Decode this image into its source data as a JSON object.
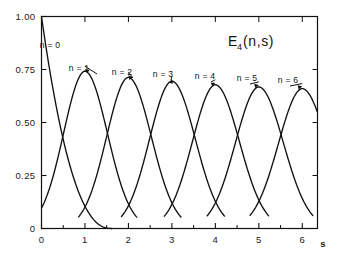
{
  "figure": {
    "title_base": "E",
    "title_subscript": "4",
    "title_args": "(n,s)",
    "background_color": "#ffffff",
    "line_color": "#111111"
  },
  "axes": {
    "x_unit": "s",
    "x_tick_labels": [
      "0",
      "1",
      "2",
      "3",
      "4",
      "5",
      "6"
    ],
    "x_tick_values": [
      0,
      1,
      2,
      3,
      4,
      5,
      6
    ],
    "x_minor_tick_values": [
      0.5,
      1.5,
      2.5,
      3.5,
      4.5,
      5.5
    ],
    "y_tick_labels": [
      "0",
      "0.25",
      "0.50",
      "0.75",
      "1.00"
    ],
    "y_tick_values": [
      0,
      0.25,
      0.5,
      0.75,
      1.0
    ],
    "xlim": [
      0,
      6.35
    ],
    "ylim": [
      0,
      1.0
    ],
    "grid": false
  },
  "curve_labels": [
    {
      "text": "n = 0",
      "n": 0,
      "has_arrow": false
    },
    {
      "text": "n = 1",
      "n": 1,
      "has_arrow": true
    },
    {
      "text": "n = 2",
      "n": 2,
      "has_arrow": true
    },
    {
      "text": "n = 3",
      "n": 3,
      "has_arrow": true
    },
    {
      "text": "n = 4",
      "n": 4,
      "has_arrow": true
    },
    {
      "text": "n = 5",
      "n": 5,
      "has_arrow": true
    },
    {
      "text": "n = 6",
      "n": 6,
      "has_arrow": true
    }
  ],
  "chart_data": {
    "type": "line",
    "xlabel": "s",
    "ylabel": "",
    "xlim": [
      0,
      6.35
    ],
    "ylim": [
      0,
      1.0
    ],
    "grid": false,
    "legend": "inline curve labels n = 0 .. n = 6",
    "x_tick_labels": [
      "0",
      "1",
      "2",
      "3",
      "4",
      "5",
      "6"
    ],
    "y_tick_labels": [
      "0",
      "0.25",
      "0.50",
      "0.75",
      "1.00"
    ],
    "series": [
      {
        "name": "n = 0",
        "peak_s": 0.0,
        "peak_value": 1.0,
        "x": [
          0.0,
          0.1,
          0.2,
          0.3,
          0.4,
          0.5,
          0.6,
          0.7,
          0.8,
          0.9,
          1.0,
          1.1,
          1.2,
          1.3,
          1.4,
          1.5
        ],
        "values": [
          1.0,
          0.9,
          0.795,
          0.69,
          0.59,
          0.495,
          0.405,
          0.325,
          0.25,
          0.185,
          0.135,
          0.092,
          0.06,
          0.035,
          0.018,
          0.006
        ]
      },
      {
        "name": "n = 1",
        "peak_s": 1.0,
        "peak_value": 0.742,
        "x": [
          0.2,
          0.4,
          0.6,
          0.8,
          1.0,
          1.2,
          1.4,
          1.6,
          1.8,
          2.0,
          2.2,
          2.4
        ],
        "values": [
          0.02,
          0.185,
          0.45,
          0.675,
          0.742,
          0.645,
          0.47,
          0.29,
          0.15,
          0.062,
          0.018,
          0.003
        ]
      },
      {
        "name": "n = 2",
        "peak_s": 2.0,
        "peak_value": 0.713,
        "x": [
          1.2,
          1.4,
          1.6,
          1.8,
          2.0,
          2.2,
          2.4,
          2.6,
          2.8,
          3.0,
          3.2,
          3.4
        ],
        "values": [
          0.01,
          0.085,
          0.27,
          0.545,
          0.713,
          0.675,
          0.52,
          0.33,
          0.175,
          0.078,
          0.025,
          0.005
        ]
      },
      {
        "name": "n = 3",
        "peak_s": 3.0,
        "peak_value": 0.695,
        "x": [
          2.2,
          2.4,
          2.6,
          2.8,
          3.0,
          3.2,
          3.4,
          3.6,
          3.8,
          4.0,
          4.2,
          4.4
        ],
        "values": [
          0.012,
          0.09,
          0.28,
          0.545,
          0.695,
          0.665,
          0.515,
          0.335,
          0.182,
          0.082,
          0.028,
          0.006
        ]
      },
      {
        "name": "n = 4",
        "peak_s": 4.0,
        "peak_value": 0.678,
        "x": [
          3.2,
          3.4,
          3.6,
          3.8,
          4.0,
          4.2,
          4.4,
          4.6,
          4.8,
          5.0,
          5.2,
          5.4
        ],
        "values": [
          0.014,
          0.095,
          0.285,
          0.545,
          0.678,
          0.655,
          0.515,
          0.34,
          0.188,
          0.086,
          0.03,
          0.007
        ]
      },
      {
        "name": "n = 5",
        "peak_s": 5.0,
        "peak_value": 0.668,
        "x": [
          4.2,
          4.4,
          4.6,
          4.8,
          5.0,
          5.2,
          5.4,
          5.6,
          5.8,
          6.0,
          6.2,
          6.35
        ],
        "values": [
          0.016,
          0.1,
          0.29,
          0.545,
          0.668,
          0.648,
          0.512,
          0.345,
          0.193,
          0.09,
          0.033,
          0.012
        ]
      },
      {
        "name": "n = 6",
        "peak_s": 6.0,
        "peak_value": 0.66,
        "x": [
          5.2,
          5.4,
          5.6,
          5.8,
          6.0,
          6.2,
          6.35
        ],
        "values": [
          0.018,
          0.105,
          0.295,
          0.545,
          0.66,
          0.6,
          0.49
        ]
      }
    ]
  }
}
